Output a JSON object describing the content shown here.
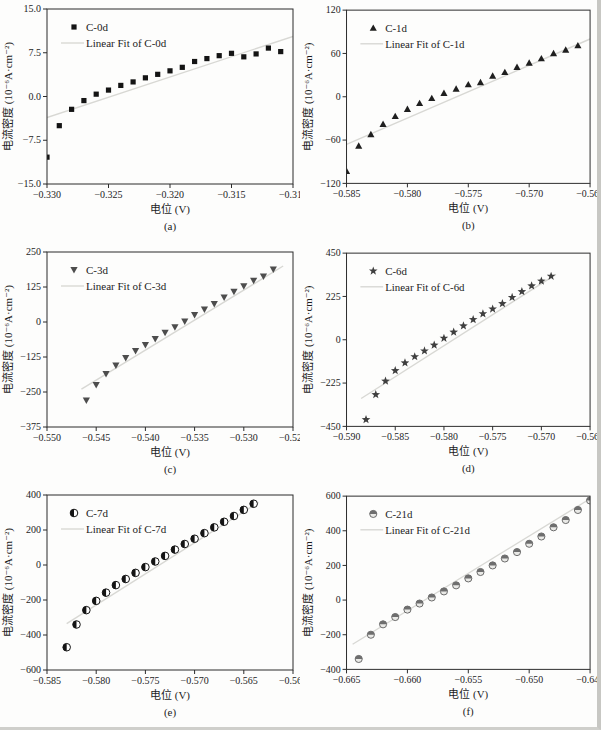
{
  "figure": {
    "background": "#fdfdfc",
    "axis_color": "#2b2b2b",
    "text_color": "#1c1c1c",
    "fit_line_color": "#d8d8d4"
  },
  "chart_data": [
    {
      "id": "a",
      "type": "scatter",
      "panel_label": "(a)",
      "legend": {
        "series_label": "C-0d",
        "fit_label": "Linear Fit of C-0d"
      },
      "marker": "square",
      "marker_color": "#141414",
      "xlabel": "电位 (V)",
      "ylabel": "电流密度 (10⁻⁶A·cm⁻²)",
      "xlim": [
        -0.33,
        -0.31
      ],
      "ylim": [
        -15.0,
        15.0
      ],
      "xtick_labels": [
        "-0.330",
        "-0.325",
        "-0.320",
        "-0.315",
        "-0.310"
      ],
      "ytick_labels": [
        "-15.0",
        "-7.5",
        "0.0",
        "7.5",
        "15.0"
      ],
      "x": [
        -0.33,
        -0.329,
        -0.328,
        -0.327,
        -0.326,
        -0.325,
        -0.324,
        -0.323,
        -0.322,
        -0.321,
        -0.32,
        -0.319,
        -0.318,
        -0.317,
        -0.316,
        -0.315,
        -0.314,
        -0.313,
        -0.312,
        -0.311
      ],
      "y": [
        -10.4,
        -5.0,
        -2.2,
        -0.7,
        0.4,
        1.1,
        1.9,
        2.5,
        3.2,
        3.8,
        4.4,
        5.0,
        6.0,
        6.5,
        7.0,
        7.4,
        6.8,
        7.3,
        8.3,
        7.7
      ],
      "fit_line": {
        "x": [
          -0.33,
          -0.31
        ],
        "y": [
          -3.6,
          10.3
        ]
      }
    },
    {
      "id": "b",
      "type": "scatter",
      "panel_label": "(b)",
      "legend": {
        "series_label": "C-1d",
        "fit_label": "Linear Fit of C-1d"
      },
      "marker": "triangle-up",
      "marker_color": "#1f1f1f",
      "xlabel": "电位 (V)",
      "ylabel": "电流密度 (10⁻⁶A·cm⁻²)",
      "xlim": [
        -0.585,
        -0.565
      ],
      "ylim": [
        -120,
        120
      ],
      "xtick_labels": [
        "-0.585",
        "-0.580",
        "-0.575",
        "-0.570",
        "-0.565"
      ],
      "ytick_labels": [
        "-120",
        "-60",
        "0",
        "60",
        "120"
      ],
      "x": [
        -0.585,
        -0.584,
        -0.583,
        -0.582,
        -0.581,
        -0.58,
        -0.579,
        -0.578,
        -0.577,
        -0.576,
        -0.575,
        -0.574,
        -0.573,
        -0.572,
        -0.571,
        -0.57,
        -0.569,
        -0.568,
        -0.567,
        -0.566
      ],
      "y": [
        -103,
        -68,
        -52,
        -38,
        -27,
        -17,
        -9,
        -2,
        5,
        11,
        17,
        20,
        29,
        34,
        41,
        47,
        53,
        60,
        65,
        71
      ],
      "fit_line": {
        "x": [
          -0.585,
          -0.565
        ],
        "y": [
          -66,
          80
        ]
      }
    },
    {
      "id": "c",
      "type": "scatter",
      "panel_label": "(c)",
      "legend": {
        "series_label": "C-3d",
        "fit_label": "Linear Fit of C-3d"
      },
      "marker": "triangle-down",
      "marker_color": "#4d4d4d",
      "xlabel": "电位 (V)",
      "ylabel": "电流密度 (10⁻⁶A·cm⁻²)",
      "xlim": [
        -0.55,
        -0.525
      ],
      "ylim": [
        -375,
        250
      ],
      "xtick_labels": [
        "-0.550",
        "-0.545",
        "-0.540",
        "-0.535",
        "-0.530",
        "-0.525"
      ],
      "ytick_labels": [
        "-375",
        "-250",
        "-125",
        "0",
        "125",
        "250"
      ],
      "x": [
        -0.546,
        -0.545,
        -0.544,
        -0.543,
        -0.542,
        -0.541,
        -0.54,
        -0.539,
        -0.538,
        -0.537,
        -0.536,
        -0.535,
        -0.534,
        -0.533,
        -0.532,
        -0.531,
        -0.53,
        -0.529,
        -0.528,
        -0.527
      ],
      "y": [
        -280,
        -225,
        -185,
        -155,
        -128,
        -103,
        -82,
        -60,
        -38,
        -18,
        2,
        25,
        45,
        65,
        88,
        108,
        128,
        148,
        163,
        188
      ],
      "fit_line": {
        "x": [
          -0.5465,
          -0.526
        ],
        "y": [
          -240,
          200
        ]
      }
    },
    {
      "id": "d",
      "type": "scatter",
      "panel_label": "(d)",
      "legend": {
        "series_label": "C-6d",
        "fit_label": "Linear Fit of C-6d"
      },
      "marker": "star",
      "marker_color": "#3f3f3f",
      "xlabel": "电位 (V)",
      "ylabel": "电流密度 (10⁻⁶A·cm⁻²)",
      "xlim": [
        -0.59,
        -0.565
      ],
      "ylim": [
        -450,
        450
      ],
      "xtick_labels": [
        "-0.590",
        "-0.585",
        "-0.580",
        "-0.575",
        "-0.570",
        "-0.565"
      ],
      "ytick_labels": [
        "-450",
        "-225",
        "0",
        "225",
        "450"
      ],
      "x": [
        -0.588,
        -0.587,
        -0.586,
        -0.585,
        -0.584,
        -0.583,
        -0.582,
        -0.581,
        -0.58,
        -0.579,
        -0.578,
        -0.577,
        -0.576,
        -0.575,
        -0.574,
        -0.573,
        -0.572,
        -0.571,
        -0.57,
        -0.569
      ],
      "y": [
        -415,
        -285,
        -215,
        -160,
        -120,
        -88,
        -58,
        -28,
        8,
        40,
        72,
        105,
        135,
        160,
        188,
        220,
        250,
        280,
        305,
        330
      ],
      "fit_line": {
        "x": [
          -0.5885,
          -0.5685
        ],
        "y": [
          -305,
          340
        ]
      }
    },
    {
      "id": "e",
      "type": "scatter",
      "panel_label": "(e)",
      "legend": {
        "series_label": "C-7d",
        "fit_label": "Linear Fit of C-7d"
      },
      "marker": "circle-half-left",
      "marker_color": "#141414",
      "xlabel": "电位 (V)",
      "ylabel": "电流密度 (10⁻⁶A·cm⁻²)",
      "xlim": [
        -0.585,
        -0.56
      ],
      "ylim": [
        -600,
        400
      ],
      "xtick_labels": [
        "-0.585",
        "-0.580",
        "-0.575",
        "-0.570",
        "-0.565",
        "-0.560"
      ],
      "ytick_labels": [
        "-600",
        "-400",
        "-200",
        "0",
        "200",
        "400"
      ],
      "x": [
        -0.583,
        -0.582,
        -0.581,
        -0.58,
        -0.579,
        -0.578,
        -0.577,
        -0.576,
        -0.575,
        -0.574,
        -0.573,
        -0.572,
        -0.571,
        -0.57,
        -0.569,
        -0.568,
        -0.567,
        -0.566,
        -0.565,
        -0.564
      ],
      "y": [
        -470,
        -340,
        -258,
        -205,
        -158,
        -115,
        -80,
        -45,
        -12,
        20,
        52,
        88,
        120,
        150,
        182,
        215,
        247,
        280,
        315,
        350
      ],
      "fit_line": {
        "x": [
          -0.583,
          -0.5635
        ],
        "y": [
          -335,
          358
        ]
      }
    },
    {
      "id": "f",
      "type": "scatter",
      "panel_label": "(f)",
      "legend": {
        "series_label": "C-21d",
        "fit_label": "Linear Fit of C-21d"
      },
      "marker": "circle-half-top",
      "marker_color": "#6e6e6e",
      "xlabel": "电位 (V)",
      "ylabel": "电流密度 (10⁻⁶A·cm⁻²)",
      "xlim": [
        -0.665,
        -0.645
      ],
      "ylim": [
        -400,
        600
      ],
      "xtick_labels": [
        "-0.665",
        "-0.660",
        "-0.655",
        "-0.650",
        "-0.645"
      ],
      "ytick_labels": [
        "-400",
        "-200",
        "0",
        "200",
        "400",
        "600"
      ],
      "x": [
        -0.664,
        -0.663,
        -0.662,
        -0.661,
        -0.66,
        -0.659,
        -0.658,
        -0.657,
        -0.656,
        -0.655,
        -0.654,
        -0.653,
        -0.652,
        -0.651,
        -0.65,
        -0.649,
        -0.648,
        -0.647,
        -0.646,
        -0.645
      ],
      "y": [
        -340,
        -200,
        -140,
        -98,
        -55,
        -20,
        15,
        50,
        85,
        125,
        162,
        200,
        240,
        277,
        325,
        367,
        420,
        462,
        520,
        575
      ],
      "fit_line": {
        "x": [
          -0.6645,
          -0.645
        ],
        "y": [
          -255,
          585
        ]
      }
    }
  ]
}
